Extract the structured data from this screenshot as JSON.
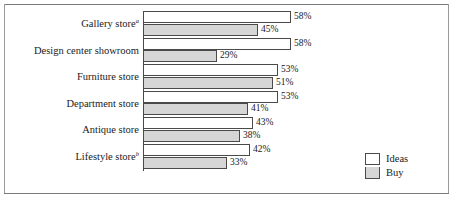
{
  "chart_data": {
    "type": "bar",
    "orientation": "horizontal",
    "title": "",
    "xlabel": "",
    "ylabel": "",
    "xlim": [
      0,
      58
    ],
    "grid": false,
    "legend_position": "right-bottom",
    "value_suffix": "%",
    "categories": [
      "Gallery store",
      "Design center showroom",
      "Furniture store",
      "Department store",
      "Antique store",
      "Lifestyle store"
    ],
    "category_markers": [
      "a",
      "",
      "",
      "",
      "",
      "b"
    ],
    "series": [
      {
        "name": "Ideas",
        "color": "#ffffff",
        "values": [
          58,
          58,
          53,
          53,
          43,
          42
        ]
      },
      {
        "name": "Buy",
        "color": "#d6d6d6",
        "values": [
          45,
          29,
          51,
          41,
          38,
          33
        ]
      }
    ],
    "value_labels": {
      "Ideas": [
        "58%",
        "58%",
        "53%",
        "53%",
        "43%",
        "42%"
      ],
      "Buy": [
        "45%",
        "29%",
        "51%",
        "41%",
        "38%",
        "33%"
      ]
    }
  },
  "legend": {
    "items": [
      {
        "label": "Ideas",
        "swatch": "white-square-swatch"
      },
      {
        "label": "Buy",
        "swatch": "gray-square-swatch"
      }
    ]
  },
  "rows": [
    {
      "label": "Gallery store",
      "marker": "a",
      "ideas_value": "58%",
      "buy_value": "45%",
      "ideas_pct": 58,
      "buy_pct": 45
    },
    {
      "label": "Design center showroom",
      "marker": "",
      "ideas_value": "58%",
      "buy_value": "29%",
      "ideas_pct": 58,
      "buy_pct": 29
    },
    {
      "label": "Furniture store",
      "marker": "",
      "ideas_value": "53%",
      "buy_value": "51%",
      "ideas_pct": 53,
      "buy_pct": 51
    },
    {
      "label": "Department store",
      "marker": "",
      "ideas_value": "53%",
      "buy_value": "41%",
      "ideas_pct": 53,
      "buy_pct": 41
    },
    {
      "label": "Antique store",
      "marker": "",
      "ideas_value": "43%",
      "buy_value": "38%",
      "ideas_pct": 43,
      "buy_pct": 38
    },
    {
      "label": "Lifestyle store",
      "marker": "b",
      "ideas_value": "42%",
      "buy_value": "33%",
      "ideas_pct": 42,
      "buy_pct": 33
    }
  ]
}
